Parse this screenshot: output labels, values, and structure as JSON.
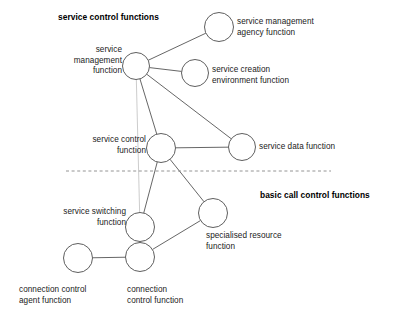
{
  "diagram": {
    "title_groups": [
      {
        "id": "service-control-functions",
        "label": "service control functions",
        "x": 58,
        "y": 12,
        "align": "left"
      },
      {
        "id": "basic-call-control-functions",
        "label": "basic call control functions",
        "x": 260,
        "y": 190,
        "align": "left"
      }
    ],
    "nodes": [
      {
        "id": "service-management-function",
        "label": "service\nmanagement\nfunction",
        "cx": 136,
        "cy": 66,
        "r": 13.5,
        "label_x": 122,
        "label_y": 45,
        "align": "right"
      },
      {
        "id": "service-management-agency-function",
        "label": "service management\nagency function",
        "cx": 219,
        "cy": 27,
        "r": 14.5,
        "label_x": 237,
        "label_y": 17,
        "align": "left"
      },
      {
        "id": "service-creation-environment-function",
        "label": "service creation\nenvironment function",
        "cx": 195,
        "cy": 73,
        "r": 13.5,
        "label_x": 212,
        "label_y": 65,
        "align": "left"
      },
      {
        "id": "service-control-function",
        "label": "service control\nfunction",
        "cx": 161,
        "cy": 148,
        "r": 14.5,
        "label_x": 146,
        "label_y": 135,
        "align": "right"
      },
      {
        "id": "service-data-function",
        "label": "service data function",
        "cx": 242,
        "cy": 147,
        "r": 13.5,
        "label_x": 259,
        "label_y": 142,
        "align": "left"
      },
      {
        "id": "service-switching-function",
        "label": "service switching\nfunction",
        "cx": 140,
        "cy": 227,
        "r": 14.5,
        "label_x": 126,
        "label_y": 207,
        "align": "right"
      },
      {
        "id": "specialised-resource-function",
        "label": "specialised resource\nfunction",
        "cx": 213,
        "cy": 213,
        "r": 14.5,
        "label_x": 206,
        "label_y": 231,
        "align": "left"
      },
      {
        "id": "connection-control-function",
        "label": "connection\ncontrol function",
        "cx": 140,
        "cy": 257,
        "r": 14.5,
        "label_x": 127,
        "label_y": 285,
        "align": "left"
      },
      {
        "id": "connection-control-agent-function",
        "label": "connection control\nagent function",
        "cx": 78,
        "cy": 258,
        "r": 14.5,
        "label_x": 19,
        "label_y": 285,
        "align": "left"
      }
    ],
    "edges": [
      {
        "id": "edge-smf-smaf",
        "from": "service-management-function",
        "to": "service-management-agency-function",
        "style": "solid"
      },
      {
        "id": "edge-smf-scef",
        "from": "service-management-function",
        "to": "service-creation-environment-function",
        "style": "solid"
      },
      {
        "id": "edge-smf-sdf",
        "from": "service-management-function",
        "to": "service-data-function",
        "style": "solid"
      },
      {
        "id": "edge-smf-scf",
        "from": "service-management-function",
        "to": "service-control-function",
        "style": "solid"
      },
      {
        "id": "edge-smf-ssf",
        "from": "service-management-function",
        "to": "service-switching-function",
        "style": "faint"
      },
      {
        "id": "edge-scf-sdf",
        "from": "service-control-function",
        "to": "service-data-function",
        "style": "solid"
      },
      {
        "id": "edge-scf-ssf",
        "from": "service-control-function",
        "to": "service-switching-function",
        "style": "solid"
      },
      {
        "id": "edge-scf-srf",
        "from": "service-control-function",
        "to": "specialised-resource-function",
        "style": "solid"
      },
      {
        "id": "edge-srf-ccf",
        "from": "specialised-resource-function",
        "to": "connection-control-function",
        "style": "solid"
      },
      {
        "id": "edge-ssf-ccf",
        "from": "service-switching-function",
        "to": "connection-control-function",
        "style": "solid"
      },
      {
        "id": "edge-ccaf-ccf",
        "from": "connection-control-agent-function",
        "to": "connection-control-function",
        "style": "solid"
      }
    ],
    "separator": {
      "id": "layer-separator",
      "x1": 66,
      "x2": 331,
      "y": 171,
      "style": "dashed"
    },
    "colors": {
      "stroke": "#555555",
      "stroke_faint": "#bfbfbf",
      "text": "#1a1a1a",
      "background": "#ffffff"
    }
  }
}
